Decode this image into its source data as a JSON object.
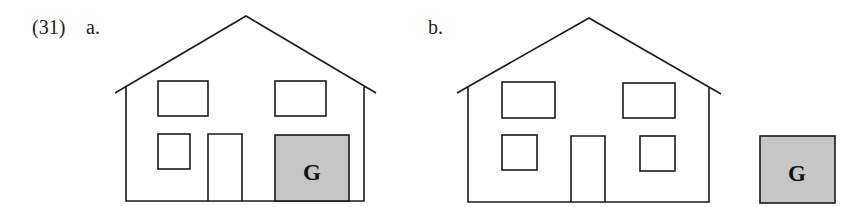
{
  "example": {
    "number": "(31)",
    "panels": [
      {
        "label": "a.",
        "garage_letter": "G",
        "garage_attached": true
      },
      {
        "label": "b.",
        "garage_letter": "G",
        "garage_attached": false
      }
    ]
  },
  "colors": {
    "stroke": "#1a1a1a",
    "garage_fill": "#c6c6c6"
  }
}
